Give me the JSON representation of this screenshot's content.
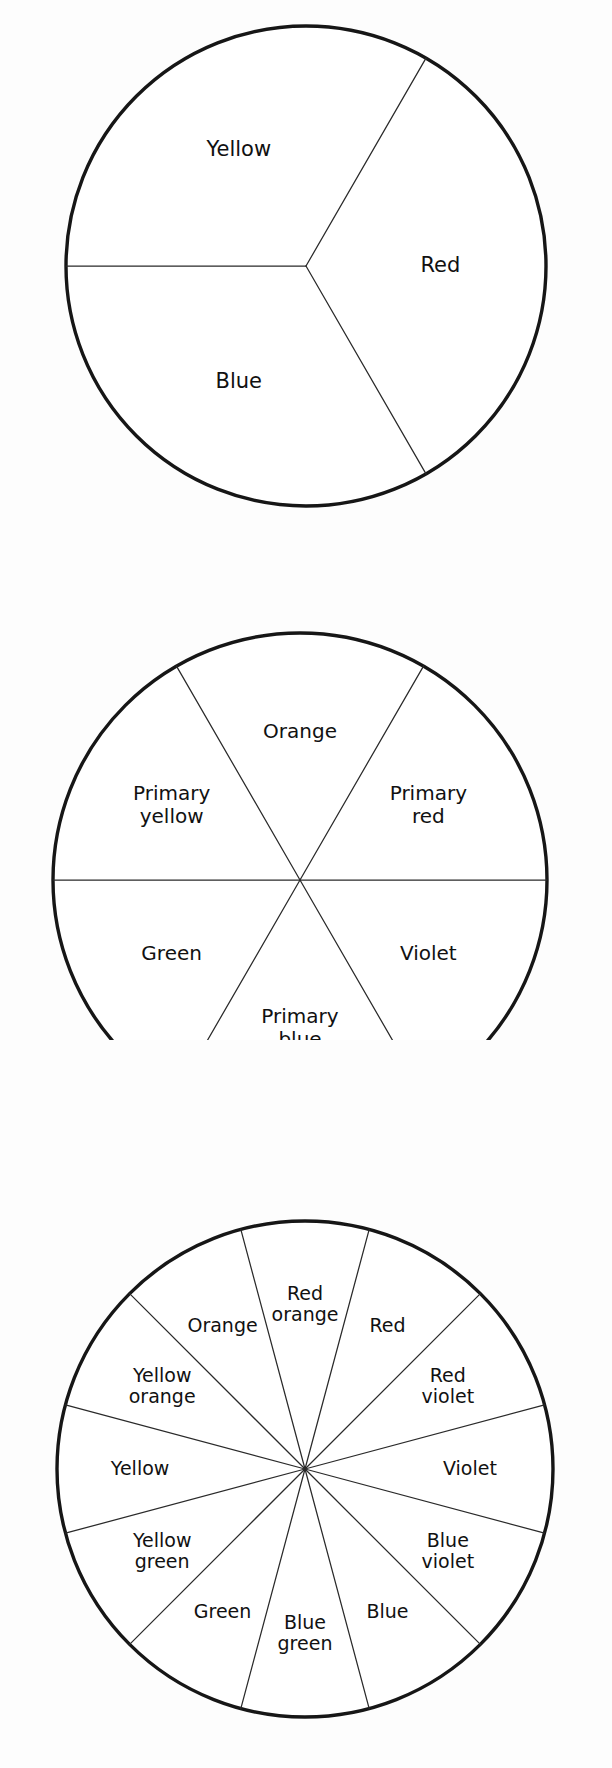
{
  "page": {
    "background_color": "#fdfdfd",
    "ink_color": "#161616",
    "width": 612,
    "height": 1768
  },
  "figures": [
    {
      "id": "primary-wheel",
      "name": "three-part-color-circle",
      "segment_count": 3,
      "center": {
        "x": 306,
        "y": 266
      },
      "radius": 240,
      "start_angle_deg": -60,
      "labels": [
        "Red",
        "Blue",
        "Yellow"
      ],
      "label_radius_factor": 0.56
    },
    {
      "id": "secondary-wheel",
      "name": "six-part-color-circle",
      "segment_count": 6,
      "center": {
        "x": 300,
        "y": 360
      },
      "radius": 247,
      "start_angle_deg": -60,
      "labels": [
        "Primary\nred",
        "Violet",
        "Primary\nblue",
        "Green",
        "Primary\nyellow",
        "Orange"
      ],
      "label_radius_factor": 0.6
    },
    {
      "id": "tertiary-wheel",
      "name": "twelve-part-color-circle",
      "segment_count": 12,
      "center": {
        "x": 305,
        "y": 429
      },
      "radius": 248,
      "start_angle_deg": -75,
      "labels": [
        "Red",
        "Red\nviolet",
        "Violet",
        "Blue\nviolet",
        "Blue",
        "Blue\ngreen",
        "Green",
        "Yellow\ngreen",
        "Yellow",
        "Yellow\norange",
        "Orange",
        "Red\norange"
      ],
      "label_radius_factor": 0.665
    }
  ],
  "chart_data": [
    {
      "type": "pie",
      "title": "Primary color circle",
      "categories": [
        "Red",
        "Blue",
        "Yellow"
      ],
      "values": [
        1,
        1,
        1
      ],
      "slice_angle_deg": 120,
      "legend": "none",
      "grid": false
    },
    {
      "type": "pie",
      "title": "Primary and secondary color circle",
      "categories": [
        "Primary red",
        "Violet",
        "Primary blue",
        "Green",
        "Primary yellow",
        "Orange"
      ],
      "values": [
        1,
        1,
        1,
        1,
        1,
        1
      ],
      "slice_angle_deg": 60,
      "legend": "none",
      "grid": false
    },
    {
      "type": "pie",
      "title": "Twelve step color circle",
      "categories": [
        "Red",
        "Red violet",
        "Violet",
        "Blue violet",
        "Blue",
        "Blue green",
        "Green",
        "Yellow green",
        "Yellow",
        "Yellow orange",
        "Orange",
        "Red orange"
      ],
      "values": [
        1,
        1,
        1,
        1,
        1,
        1,
        1,
        1,
        1,
        1,
        1,
        1
      ],
      "slice_angle_deg": 30,
      "legend": "none",
      "grid": false
    }
  ]
}
